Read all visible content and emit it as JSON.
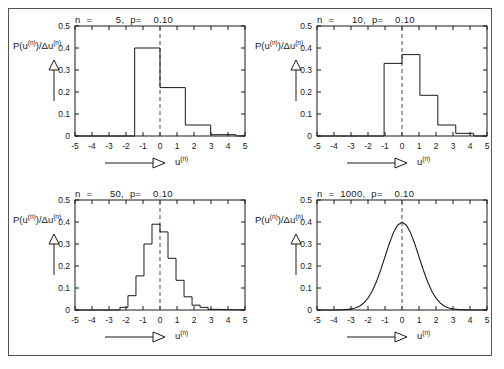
{
  "figure": {
    "y_axis_label": "P(u(n))/Δu(n)",
    "x_axis_label": "u(n)",
    "x_ticks": [
      "-5",
      "-4",
      "-3",
      "-2",
      "-1",
      "0",
      "1",
      "2",
      "3",
      "4",
      "5"
    ],
    "y_ticks": [
      "0",
      "0.1",
      "0.2",
      "0.3",
      "0.4",
      "0.5"
    ],
    "axis_color": "#1a1a1a",
    "curve_color": "#1a1a1a",
    "mean_line_color": "#4a4a4a",
    "border_color": "#555555"
  },
  "chart_data": [
    {
      "type": "bar",
      "panel": "top-left",
      "title": "n  =        5,  p=    0.10",
      "n": 5,
      "p": 0.1,
      "xlabel": "u(n)",
      "ylabel": "P(u(n))/Δu(n)",
      "xlim": [
        -5,
        5
      ],
      "ylim": [
        0,
        0.5
      ],
      "xticks": [
        -5,
        -4,
        -3,
        -2,
        -1,
        0,
        1,
        2,
        3,
        4,
        5
      ],
      "yticks": [
        0,
        0.1,
        0.2,
        0.3,
        0.4,
        0.5
      ],
      "grid": false,
      "mean_line_x": 0,
      "bin_width": 1.49,
      "bin_edges": [
        -1.49,
        0.0,
        1.49,
        2.98,
        4.47,
        5.0
      ],
      "values": [
        0.4,
        0.22,
        0.05,
        0.006,
        0.0
      ]
    },
    {
      "type": "bar",
      "panel": "top-right",
      "title": "n  =      10,  p=    0.10",
      "n": 10,
      "p": 0.1,
      "xlabel": "u(n)",
      "ylabel": "P(u(n))/Δu(n)",
      "xlim": [
        -5,
        5
      ],
      "ylim": [
        0,
        0.5
      ],
      "xticks": [
        -5,
        -4,
        -3,
        -2,
        -1,
        0,
        1,
        2,
        3,
        4,
        5
      ],
      "yticks": [
        0,
        0.1,
        0.2,
        0.3,
        0.4,
        0.5
      ],
      "grid": false,
      "mean_line_x": 0,
      "bin_width": 1.054,
      "bin_edges": [
        -1.054,
        0.0,
        1.054,
        2.108,
        3.162,
        4.216,
        5.0
      ],
      "values": [
        0.33,
        0.37,
        0.185,
        0.05,
        0.012,
        0.0
      ]
    },
    {
      "type": "bar",
      "panel": "bottom-left",
      "title": "n  =      50,  p=    0.10",
      "n": 50,
      "p": 0.1,
      "xlabel": "u(n)",
      "ylabel": "P(u(n))/Δu(n)",
      "xlim": [
        -5,
        5
      ],
      "ylim": [
        0,
        0.5
      ],
      "xticks": [
        -5,
        -4,
        -3,
        -2,
        -1,
        0,
        1,
        2,
        3,
        4,
        5
      ],
      "yticks": [
        0,
        0.1,
        0.2,
        0.3,
        0.4,
        0.5
      ],
      "grid": false,
      "mean_line_x": 0,
      "bin_width": 0.4714,
      "bin_edges": [
        -2.357,
        -1.886,
        -1.414,
        -0.943,
        -0.471,
        0.0,
        0.471,
        0.943,
        1.414,
        1.886,
        2.357,
        2.828,
        3.3
      ],
      "values": [
        0.012,
        0.065,
        0.155,
        0.3,
        0.39,
        0.355,
        0.235,
        0.135,
        0.06,
        0.022,
        0.012,
        0.003
      ]
    },
    {
      "type": "line",
      "panel": "bottom-right",
      "title": "n  =  1000,  p=    0.10",
      "n": 1000,
      "p": 0.1,
      "xlabel": "u(n)",
      "ylabel": "P(u(n))/Δu(n)",
      "xlim": [
        -5,
        5
      ],
      "ylim": [
        0,
        0.5
      ],
      "xticks": [
        -5,
        -4,
        -3,
        -2,
        -1,
        0,
        1,
        2,
        3,
        4,
        5
      ],
      "yticks": [
        0,
        0.1,
        0.2,
        0.3,
        0.4,
        0.5
      ],
      "grid": false,
      "mean_line_x": 0,
      "peak_value": 0.4,
      "x": [
        -5,
        -4.5,
        -4,
        -3.5,
        -3,
        -2.75,
        -2.5,
        -2.25,
        -2,
        -1.75,
        -1.5,
        -1.25,
        -1,
        -0.75,
        -0.5,
        -0.25,
        0,
        0.25,
        0.5,
        0.75,
        1,
        1.25,
        1.5,
        1.75,
        2,
        2.25,
        2.5,
        2.75,
        3,
        3.5,
        4,
        4.5,
        5
      ],
      "y": [
        0.0,
        0.0,
        0.0001,
        0.0009,
        0.0044,
        0.0091,
        0.0175,
        0.0317,
        0.054,
        0.0863,
        0.1295,
        0.1826,
        0.242,
        0.3011,
        0.3521,
        0.3867,
        0.3989,
        0.3867,
        0.3521,
        0.3011,
        0.242,
        0.1826,
        0.1295,
        0.0863,
        0.054,
        0.0317,
        0.0175,
        0.0091,
        0.0044,
        0.0009,
        0.0001,
        0.0,
        0.0
      ]
    }
  ]
}
